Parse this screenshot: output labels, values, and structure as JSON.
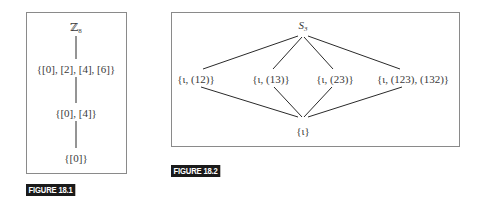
{
  "figure_18_1": {
    "caption": "FIGURE 18.1",
    "nodes": [
      {
        "id": "z8",
        "base": "ℤ",
        "sub": "8",
        "x": 76,
        "y": 28
      },
      {
        "id": "sub4",
        "label": "{[0], [2], [4], [6]}",
        "x": 76,
        "y": 69
      },
      {
        "id": "sub2",
        "label": "{[0], [4]}",
        "x": 76,
        "y": 113
      },
      {
        "id": "sub1",
        "label": "{[0]}",
        "x": 76,
        "y": 158
      }
    ],
    "edges": [
      [
        "z8",
        "sub4"
      ],
      [
        "sub4",
        "sub2"
      ],
      [
        "sub2",
        "sub1"
      ]
    ]
  },
  "figure_18_2": {
    "caption": "FIGURE 18.2",
    "nodes": [
      {
        "id": "s3",
        "base": "S",
        "sub": "3",
        "x": 303,
        "y": 26
      },
      {
        "id": "h12",
        "label": "{ι, (12)}",
        "x": 196,
        "y": 79
      },
      {
        "id": "h13",
        "label": "{ι, (13)}",
        "x": 271,
        "y": 79
      },
      {
        "id": "h23",
        "label": "{ι, (23)}",
        "x": 335,
        "y": 79
      },
      {
        "id": "a3",
        "label": "{ι, (123), (132)}",
        "x": 413,
        "y": 79
      },
      {
        "id": "triv",
        "label": "{ι}",
        "x": 303,
        "y": 131
      }
    ],
    "edges": [
      [
        "s3",
        "h12"
      ],
      [
        "s3",
        "h13"
      ],
      [
        "s3",
        "h23"
      ],
      [
        "s3",
        "a3"
      ],
      [
        "h12",
        "triv"
      ],
      [
        "h13",
        "triv"
      ],
      [
        "h23",
        "triv"
      ],
      [
        "a3",
        "triv"
      ]
    ]
  },
  "colors": {
    "line": "#2a2a2a",
    "border": "#8a8a8a",
    "caption_bg": "#1a1a1a",
    "caption_fg": "#ffffff"
  }
}
